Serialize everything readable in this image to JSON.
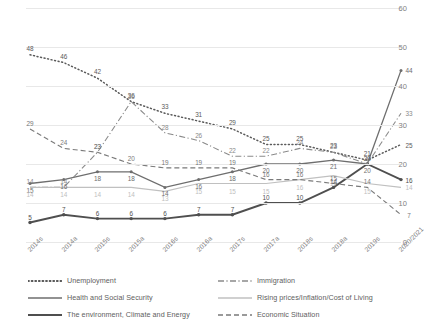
{
  "chart_data": {
    "type": "line",
    "title": "",
    "xlabel": "",
    "ylabel": "",
    "ylim": [
      0,
      60
    ],
    "ytick_step": 10,
    "grid": true,
    "legend_position": "bottom",
    "categories": [
      "2014s",
      "2014a",
      "2015s",
      "2015a",
      "2016s",
      "2016a",
      "2017s",
      "2017a",
      "2018s",
      "2018a",
      "2019s",
      "2020/2021"
    ],
    "yticks": [
      "0",
      "10",
      "20",
      "30",
      "40",
      "50",
      "60"
    ],
    "series": [
      {
        "name": "Unemployment",
        "style": "dotted",
        "color": "#5a5a5a",
        "values": [
          48,
          46,
          42,
          36,
          33,
          31,
          29,
          25,
          25,
          23,
          21,
          25
        ]
      },
      {
        "name": "Health and Social Security",
        "style": "solid-thin",
        "color": "#6e6e6e",
        "values": [
          15,
          16,
          18,
          18,
          14,
          16,
          18,
          20,
          20,
          21,
          20,
          44
        ]
      },
      {
        "name": "The environment, Climate and Energy",
        "style": "solid-thick",
        "color": "#4f4f4f",
        "values": [
          5,
          7,
          6,
          6,
          6,
          7,
          7,
          10,
          10,
          14,
          20,
          16
        ]
      },
      {
        "name": "Immigration",
        "style": "dash-dot",
        "color": "#8a8a8a",
        "values": [
          14,
          14,
          23,
          36,
          28,
          26,
          22,
          22,
          24,
          23,
          20,
          33
        ]
      },
      {
        "name": "Rising prices/Inflation/Cost of Living",
        "style": "solid-light",
        "color": "#c0c0c0",
        "values": [
          14,
          14,
          14,
          14,
          13,
          15,
          15,
          15,
          16,
          17,
          15,
          14
        ]
      },
      {
        "name": "Economic Situation",
        "style": "dashed",
        "color": "#7a7a7a",
        "values": [
          29,
          24,
          23,
          20,
          19,
          19,
          19,
          16,
          16,
          15,
          14,
          7
        ]
      }
    ]
  }
}
